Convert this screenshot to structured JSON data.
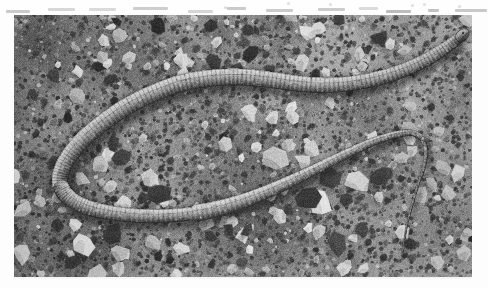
{
  "page": {
    "kind": "scanned-book-page",
    "background_color": "#fdfdfd",
    "width": 488,
    "height": 288
  },
  "cutoff_text_row": {
    "description": "bottom sliver of a cut-off line of printed text at the very top edge of the scan",
    "visible_text": "",
    "ink_color": "#9a9a9a",
    "fragment_count": 14
  },
  "photograph": {
    "caption": "",
    "alt": "Black-and-white photograph of a legless lizard (slow worm / glass lizard) lying in an S-curve on bare gravel ground",
    "color_mode": "grayscale",
    "x": 14,
    "y": 15,
    "width": 458,
    "height": 262,
    "background_label": "gravel and small stones",
    "background_tone_hex": "#8d8d8d",
    "highlight_tone_hex": "#d8d8d8",
    "shadow_tone_hex": "#3a3a3a",
    "subject": {
      "name": "legless lizard",
      "body_tone_hex": "#b5b0a6",
      "body_shadow_hex": "#4a4741",
      "texture": "transverse annulations / ring-like body segments",
      "head_position": "right of centre, upper area, snout pointing right",
      "tail_position": "lower right, tapering to a fine point",
      "pose": "large S-curve: wide left U-turn, mid-body sweep right, right-hand bend down to tail"
    }
  },
  "chart_data": null
}
